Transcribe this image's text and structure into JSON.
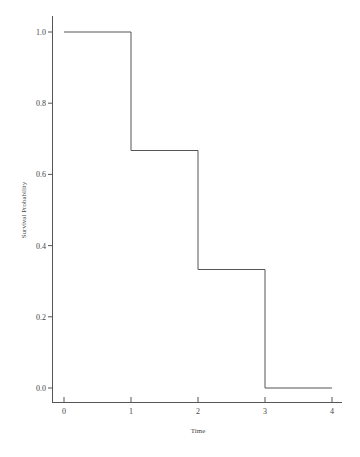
{
  "chart_data": {
    "type": "line",
    "subtype": "step",
    "title": "",
    "xlabel": "Time",
    "ylabel": "Survival Probability",
    "xlim": [
      0,
      4
    ],
    "ylim": [
      0.0,
      1.0
    ],
    "x_ticks": [
      "0",
      "1",
      "2",
      "3",
      "4"
    ],
    "y_ticks": [
      "0.0",
      "0.2",
      "0.4",
      "0.6",
      "0.8",
      "1.0"
    ],
    "grid": false,
    "legend": null,
    "series": [
      {
        "name": "Survival function",
        "x": [
          0,
          1,
          1,
          2,
          2,
          3,
          3,
          4
        ],
        "y": [
          1.0,
          1.0,
          0.667,
          0.667,
          0.333,
          0.333,
          0.0,
          0.0
        ],
        "steps": [
          {
            "from": 0,
            "to": 1,
            "value": 1.0
          },
          {
            "from": 1,
            "to": 2,
            "value": 0.667
          },
          {
            "from": 2,
            "to": 3,
            "value": 0.333
          },
          {
            "from": 3,
            "to": 4,
            "value": 0.0
          }
        ]
      }
    ]
  },
  "caption": {
    "text": "…"
  }
}
